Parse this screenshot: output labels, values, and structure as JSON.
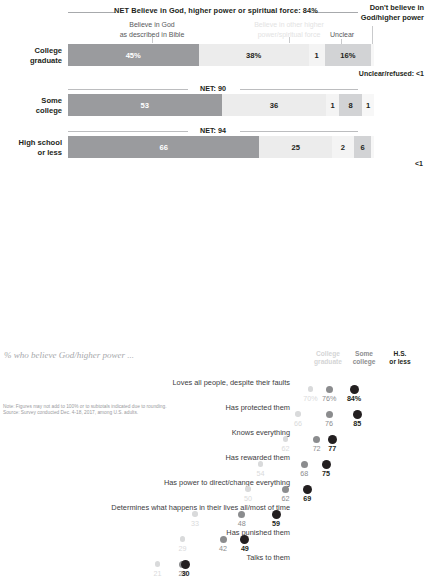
{
  "top_chart": {
    "net_header": "NET Believe in God, higher power or spiritual force: 84%",
    "dont_believe_label": "Don't believe in\nGod/higher power",
    "key_bible": "Believe in God\nas described in Bible",
    "key_other": "Believe in other higher\npower/spiritual force",
    "key_unclear": "Unclear",
    "unclear_refused_note": "Unclear/refused: <1",
    "lt1_note": "<1",
    "rows": [
      {
        "label": "College\ngraduate",
        "net": "",
        "segments": [
          {
            "name": "believe-bible",
            "value": 45,
            "display": "45%"
          },
          {
            "name": "believe-other",
            "value": 38,
            "display": "38%"
          },
          {
            "name": "unclear",
            "value": 1,
            "display": "1"
          },
          {
            "name": "dont-believe",
            "value": 16,
            "display": "16%"
          }
        ]
      },
      {
        "label": "Some\ncollege",
        "net": "NET: 90",
        "segments": [
          {
            "name": "believe-bible",
            "value": 53,
            "display": "53"
          },
          {
            "name": "believe-other",
            "value": 36,
            "display": "36"
          },
          {
            "name": "unclear",
            "value": 1,
            "display": "1"
          },
          {
            "name": "dont-believe",
            "value": 8,
            "display": "8"
          },
          {
            "name": "refused",
            "value": 1,
            "display": "1"
          }
        ]
      },
      {
        "label": "High school\nor less",
        "net": "NET: 94",
        "segments": [
          {
            "name": "believe-bible",
            "value": 66,
            "display": "66"
          },
          {
            "name": "believe-other",
            "value": 25,
            "display": "25"
          },
          {
            "name": "unclear",
            "value": 2,
            "display": "2"
          },
          {
            "name": "dont-believe",
            "value": 6,
            "display": "6"
          }
        ]
      }
    ]
  },
  "bottom_chart": {
    "title": "% who believe God/higher power ...",
    "columns": [
      {
        "label": "College\ngraduate",
        "key": "college_graduate"
      },
      {
        "label": "Some\ncollege",
        "key": "some_college"
      },
      {
        "label": "H.S.\nor less",
        "key": "hs_or_less"
      }
    ],
    "rows": [
      {
        "label": "Loves all people, despite their faults",
        "values": [
          70,
          76,
          84
        ],
        "display": [
          "70%",
          "76%",
          "84%"
        ]
      },
      {
        "label": "Has protected them",
        "values": [
          66,
          76,
          85
        ],
        "display": [
          "66",
          "76",
          "85"
        ]
      },
      {
        "label": "Knows everything",
        "values": [
          62,
          72,
          77
        ],
        "display": [
          "62",
          "72",
          "77"
        ]
      },
      {
        "label": "Has rewarded them",
        "values": [
          54,
          68,
          75
        ],
        "display": [
          "54",
          "68",
          "75"
        ]
      },
      {
        "label": "Has power to direct/change everything",
        "values": [
          50,
          62,
          69
        ],
        "display": [
          "50",
          "62",
          "69"
        ]
      },
      {
        "label": "Determines what happens in their lives all/most of time",
        "values": [
          33,
          48,
          59
        ],
        "display": [
          "33",
          "48",
          "59"
        ]
      },
      {
        "label": "Has punished them",
        "values": [
          29,
          42,
          49
        ],
        "display": [
          "29",
          "42",
          "49"
        ]
      },
      {
        "label": "Talks to them",
        "values": [
          21,
          29,
          30
        ],
        "display": [
          "21",
          "29",
          "30"
        ]
      }
    ]
  },
  "footer": {
    "note": "Note: Figures may not add to 100% or to subtotals indicated due to rounding.",
    "source": "Source: Survey conducted Dec. 4-18, 2017, among U.S. adults."
  },
  "chart_data": {
    "type": "bar",
    "title": "NET Believe in God, higher power or spiritual force: 84%",
    "categories": [
      "College graduate",
      "Some college",
      "High school or less"
    ],
    "series": [
      {
        "name": "Believe in God as described in Bible",
        "values": [
          45,
          53,
          66
        ],
        "color": "#9a9b9e"
      },
      {
        "name": "Believe in other higher power/spiritual force",
        "values": [
          38,
          36,
          25
        ],
        "color": "#ececec"
      },
      {
        "name": "Unclear",
        "values": [
          1,
          1,
          2
        ],
        "color": "#f4f4f4"
      },
      {
        "name": "Don't believe in God/higher power",
        "values": [
          16,
          8,
          6
        ],
        "color": "#d2d3d5"
      },
      {
        "name": "Unclear/refused",
        "values": [
          0.5,
          1,
          0.5
        ],
        "color": "#f7f7f7"
      }
    ],
    "net_totals": [
      84,
      90,
      94
    ],
    "xlabel": "",
    "ylabel": "",
    "stacked": true,
    "orientation": "horizontal",
    "secondary_chart": {
      "type": "scatter",
      "title": "% who believe God/higher power ...",
      "series_names": [
        "College graduate",
        "Some college",
        "H.S. or less"
      ],
      "colors": [
        "#d9dadb",
        "#8b8c8e",
        "#231f20"
      ],
      "categories": [
        "Loves all people, despite their faults",
        "Has protected them",
        "Knows everything",
        "Has rewarded them",
        "Has power to direct/change everything",
        "Determines what happens in their lives all/most of time",
        "Has punished them",
        "Talks to them"
      ],
      "values": [
        [
          70,
          76,
          84
        ],
        [
          66,
          76,
          85
        ],
        [
          62,
          72,
          77
        ],
        [
          54,
          68,
          75
        ],
        [
          50,
          62,
          69
        ],
        [
          33,
          48,
          59
        ],
        [
          29,
          42,
          49
        ],
        [
          21,
          29,
          30
        ]
      ],
      "xlim": [
        0,
        100
      ]
    }
  }
}
